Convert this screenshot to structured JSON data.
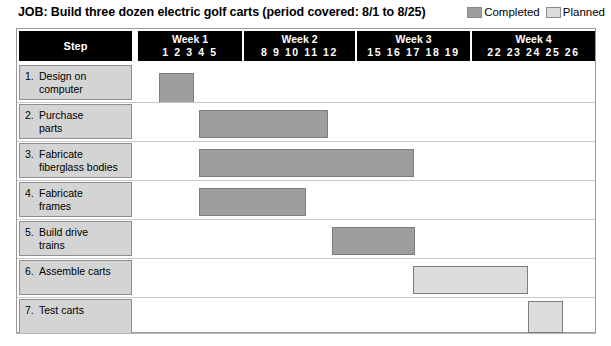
{
  "header": {
    "job_title": "JOB: Build three dozen electric golf carts (period covered: 8/1 to 8/25)",
    "legend": [
      {
        "label": "Completed",
        "color": "#9e9e9e",
        "key": "completed"
      },
      {
        "label": "Planned",
        "color": "#dcdcdc",
        "key": "planned"
      }
    ]
  },
  "table": {
    "step_column_header": "Step",
    "week_columns": [
      {
        "name": "Week 1",
        "days": "1  2  3  4  5",
        "left": 121,
        "width": 104
      },
      {
        "name": "Week 2",
        "days": "8  9  10  11  12",
        "left": 227,
        "width": 111
      },
      {
        "name": "Week 3",
        "days": "15  16  17  18  19",
        "left": 340,
        "width": 113
      },
      {
        "name": "Week 4",
        "days": "22  23  24  25  26",
        "left": 455,
        "width": 123
      }
    ]
  },
  "chart_data": {
    "type": "bar",
    "title": "JOB: Build three dozen electric golf carts (period covered: 8/1 to 8/25)",
    "xlabel": "",
    "ylabel": "Step",
    "orientation": "horizontal",
    "grid": false,
    "legend_position": "top-right",
    "axis_day_ticks": [
      1,
      2,
      3,
      4,
      5,
      8,
      9,
      10,
      11,
      12,
      15,
      16,
      17,
      18,
      19,
      22,
      23,
      24,
      25,
      26
    ],
    "categories": [
      "1. Design on computer",
      "2. Purchase parts",
      "3. Fabricate fiberglass bodies",
      "4. Fabricate frames",
      "5. Build drive trains",
      "6. Assemble carts",
      "7. Test carts"
    ],
    "series": [
      {
        "name": "Completed",
        "color": "#9e9e9e",
        "bars": [
          {
            "category": "1. Design on computer",
            "start_day": 2,
            "end_day": 3
          },
          {
            "category": "2. Purchase parts",
            "start_day": 3,
            "end_day": 9
          },
          {
            "category": "3. Fabricate fiberglass bodies",
            "start_day": 3,
            "end_day": 13
          },
          {
            "category": "4. Fabricate frames",
            "start_day": 3,
            "end_day": 8
          },
          {
            "category": "5. Build drive trains",
            "start_day": 9,
            "end_day": 13
          }
        ]
      },
      {
        "name": "Planned",
        "color": "#dcdcdc",
        "bars": [
          {
            "category": "6. Assemble carts",
            "start_day": 13,
            "end_day": 19
          },
          {
            "category": "7. Test carts",
            "start_day": 19,
            "end_day": 21
          }
        ]
      }
    ]
  },
  "rows": [
    {
      "num": "1.",
      "text": "Design on computer",
      "text_line1": "Design on",
      "text_line2": "computer",
      "top": 34,
      "height": 39,
      "cell_top": 36,
      "cell_height": 35,
      "bar": {
        "left": 142,
        "width": 35,
        "top": 44,
        "height": 30,
        "kind": "completed"
      }
    },
    {
      "num": "2.",
      "text": "Purchase parts",
      "text_line1": "Purchase",
      "text_line2": "parts",
      "top": 73,
      "height": 39,
      "cell_top": 75,
      "cell_height": 35,
      "bar": {
        "left": 182,
        "width": 129,
        "top": 81,
        "height": 28,
        "kind": "completed"
      }
    },
    {
      "num": "3.",
      "text": "Fabricate fiberglass bodies",
      "text_line1": "Fabricate",
      "text_line2": "fiberglass bodies",
      "top": 112,
      "height": 39,
      "cell_top": 114,
      "cell_height": 35,
      "bar": {
        "left": 182,
        "width": 215,
        "top": 120,
        "height": 28,
        "kind": "completed"
      }
    },
    {
      "num": "4.",
      "text": "Fabricate frames",
      "text_line1": "Fabricate",
      "text_line2": "frames",
      "top": 151,
      "height": 39,
      "cell_top": 153,
      "cell_height": 35,
      "bar": {
        "left": 182,
        "width": 107,
        "top": 159,
        "height": 28,
        "kind": "completed"
      }
    },
    {
      "num": "5.",
      "text": "Build drive trains",
      "text_line1": "Build drive",
      "text_line2": "trains",
      "top": 190,
      "height": 39,
      "cell_top": 192,
      "cell_height": 35,
      "bar": {
        "left": 315,
        "width": 83,
        "top": 198,
        "height": 28,
        "kind": "completed"
      }
    },
    {
      "num": "6.",
      "text": "Assemble carts",
      "text_line1": "Assemble carts",
      "text_line2": "",
      "top": 229,
      "height": 39,
      "cell_top": 231,
      "cell_height": 35,
      "bar": {
        "left": 396,
        "width": 115,
        "top": 237,
        "height": 28,
        "kind": "planned"
      }
    },
    {
      "num": "7.",
      "text": "Test carts",
      "text_line1": "Test carts",
      "text_line2": "",
      "top": 268,
      "height": 37,
      "cell_top": 270,
      "cell_height": 35,
      "bar": {
        "left": 511,
        "width": 35,
        "top": 272,
        "height": 32,
        "kind": "planned"
      }
    }
  ]
}
